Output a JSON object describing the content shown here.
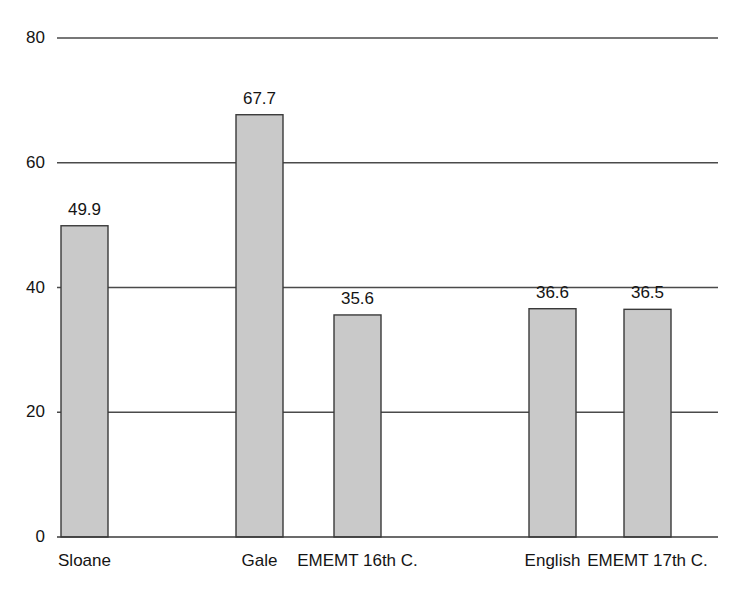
{
  "chart_data": {
    "type": "bar",
    "title": "",
    "subtitle": "",
    "xlabel": "",
    "ylabel": "",
    "categories": [
      "Sloane",
      "Gale",
      "EMEMT 16th C.",
      "English",
      "EMEMT 17th C."
    ],
    "values": [
      49.9,
      67.7,
      35.6,
      36.6,
      36.5
    ],
    "value_labels": [
      "49.9",
      "67.7",
      "35.6",
      "36.6",
      "36.5"
    ],
    "ylim": [
      0,
      80
    ],
    "yticks": [
      0,
      20,
      40,
      60,
      80
    ],
    "ytick_labels": [
      "0",
      "20",
      "40",
      "60",
      "80"
    ],
    "grid": "horizontal",
    "legend": "none",
    "bar_fill_color": "#c9c9c9",
    "bar_border_color": "#3a3a3a",
    "gridline_color": "#4a4a4a",
    "axis_color": "#3a3a3a",
    "text_color": "#141414",
    "background_color": "#ffffff"
  }
}
